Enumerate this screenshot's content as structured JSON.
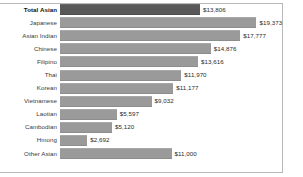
{
  "chart_data": {
    "type": "bar",
    "orientation": "horizontal",
    "title": "",
    "subtitle": "",
    "xlabel": "",
    "ylabel": "",
    "grid": false,
    "legend": "none",
    "axis_visible": false,
    "xlim": [
      0,
      21500
    ],
    "value_prefix": "$",
    "categories": [
      "Total Asian",
      "Japanese",
      "Asian Indian",
      "Chinese",
      "Filipino",
      "Thai",
      "Korean",
      "Vietnamese",
      "Laotian",
      "Cambodian",
      "Hmong",
      "Other Asian"
    ],
    "values": [
      13806,
      19373,
      17777,
      14876,
      13616,
      11970,
      11177,
      9032,
      5597,
      5120,
      2692,
      11000
    ],
    "value_labels": [
      "$13,806",
      "$19,373",
      "$17,777",
      "$14,876",
      "$13,616",
      "$11,970",
      "$11,177",
      "$9,032",
      "$5,597",
      "$5,120",
      "$2,692",
      "$11,000"
    ],
    "highlight_index": 0,
    "colors": {
      "bar": "#9a9a9a",
      "bar_highlight": "#585858",
      "border": "#b9b9b9",
      "background": "#ffffff",
      "label_text": "#3a3a3a",
      "value_text": "#2b2b2b"
    }
  }
}
